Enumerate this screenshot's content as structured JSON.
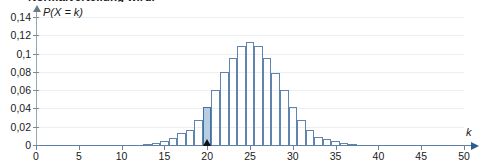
{
  "heading": {
    "text": "Normalverteilung wird."
  },
  "axes": {
    "y_title": "P(X = k)",
    "x_title": "k",
    "y_ticks": [
      "0",
      "0,02",
      "0,04",
      "0,06",
      "0,08",
      "0,1",
      "0,12",
      "0,14"
    ],
    "x_ticks": [
      "0",
      "5",
      "10",
      "15",
      "20",
      "25",
      "30",
      "35",
      "40",
      "45",
      "50"
    ]
  },
  "colors": {
    "bar_stroke": "#5f84ad",
    "highlight_fill": "#b6cde3",
    "highlight_stroke": "#44709e",
    "gridline": "#eceff1",
    "x_axis": "#5b7fa6",
    "y_axis": "#9aa6ad",
    "marker": "#111111"
  },
  "highlight": {
    "k": 20,
    "value": 0.042,
    "marker_label": "triangle-marker-at-20"
  },
  "chart_data": {
    "type": "bar",
    "title": "",
    "subtitle": "",
    "xlabel": "k",
    "ylabel": "P(X = k)",
    "xlim": [
      0,
      50
    ],
    "ylim": [
      0,
      0.145
    ],
    "grid": true,
    "legend": "none",
    "highlighted_category": 20,
    "annotations": [
      {
        "type": "marker",
        "shape": "triangle",
        "x": 20,
        "y": 0,
        "color": "#111111"
      }
    ],
    "categories": [
      0,
      1,
      2,
      3,
      4,
      5,
      6,
      7,
      8,
      9,
      10,
      11,
      12,
      13,
      14,
      15,
      16,
      17,
      18,
      19,
      20,
      21,
      22,
      23,
      24,
      25,
      26,
      27,
      28,
      29,
      30,
      31,
      32,
      33,
      34,
      35,
      36,
      37,
      38,
      39,
      40,
      41,
      42,
      43,
      44,
      45,
      46,
      47,
      48,
      49,
      50
    ],
    "values": [
      0,
      0,
      0,
      0,
      0,
      0,
      0,
      0,
      0,
      0,
      0,
      0,
      0,
      0.0008,
      0.0019,
      0.004,
      0.0076,
      0.0132,
      0.0159,
      0.0271,
      0.042,
      0.0601,
      0.0795,
      0.0953,
      0.108,
      0.1128,
      0.108,
      0.0953,
      0.079,
      0.0601,
      0.042,
      0.0271,
      0.0159,
      0.0087,
      0.0061,
      0.0044,
      0.0018,
      0.0008,
      0,
      0,
      0,
      0,
      0,
      0,
      0,
      0,
      0,
      0,
      0,
      0,
      0
    ]
  }
}
